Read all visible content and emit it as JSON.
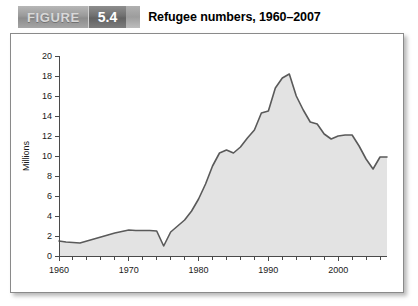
{
  "figure": {
    "label_word": "FIGURE",
    "number": "5.4",
    "title": "Refugee numbers, 1960–2007"
  },
  "chart_data": {
    "type": "area",
    "title": "Refugee numbers, 1960–2007",
    "xlabel": "",
    "ylabel": "Millions",
    "xlim": [
      1960,
      2007
    ],
    "ylim": [
      0,
      20
    ],
    "y_ticks": [
      0,
      2,
      4,
      6,
      8,
      10,
      12,
      14,
      16,
      18,
      20
    ],
    "y_tick_labels": [
      "0",
      "2",
      "4",
      "6",
      "8",
      "10",
      "12",
      "14",
      "16",
      "18",
      "20"
    ],
    "x_ticks": [
      1960,
      1962,
      1964,
      1966,
      1968,
      1970,
      1972,
      1974,
      1976,
      1978,
      1980,
      1982,
      1984,
      1986,
      1988,
      1990,
      1992,
      1994,
      1996,
      1998,
      2000,
      2002,
      2004,
      2006
    ],
    "x_tick_labels_shown": [
      "1960",
      "1970",
      "1980",
      "1990",
      "2000"
    ],
    "x_labelled_ticks": [
      1960,
      1970,
      1980,
      1990,
      2000
    ],
    "grid": false,
    "legend": false,
    "series": [
      {
        "name": "Refugees",
        "units": "millions",
        "x": [
          1960,
          1961,
          1962,
          1963,
          1964,
          1965,
          1966,
          1967,
          1968,
          1969,
          1970,
          1971,
          1972,
          1973,
          1974,
          1975,
          1976,
          1977,
          1978,
          1979,
          1980,
          1981,
          1982,
          1983,
          1984,
          1985,
          1986,
          1987,
          1988,
          1989,
          1990,
          1991,
          1992,
          1993,
          1994,
          1995,
          1996,
          1997,
          1998,
          1999,
          2000,
          2001,
          2002,
          2003,
          2004,
          2005,
          2006,
          2007
        ],
        "values": [
          1.5,
          1.4,
          1.35,
          1.3,
          1.5,
          1.7,
          1.9,
          2.1,
          2.3,
          2.45,
          2.6,
          2.55,
          2.55,
          2.55,
          2.5,
          1.0,
          2.4,
          3.0,
          3.6,
          4.5,
          5.7,
          7.2,
          9.0,
          10.3,
          10.6,
          10.3,
          10.9,
          11.8,
          12.6,
          14.3,
          14.5,
          16.8,
          17.8,
          18.2,
          16.0,
          14.6,
          13.4,
          13.2,
          12.2,
          11.7,
          12.0,
          12.1,
          12.1,
          11.0,
          9.7,
          8.7,
          9.9,
          9.9
        ]
      }
    ],
    "annotations": []
  }
}
